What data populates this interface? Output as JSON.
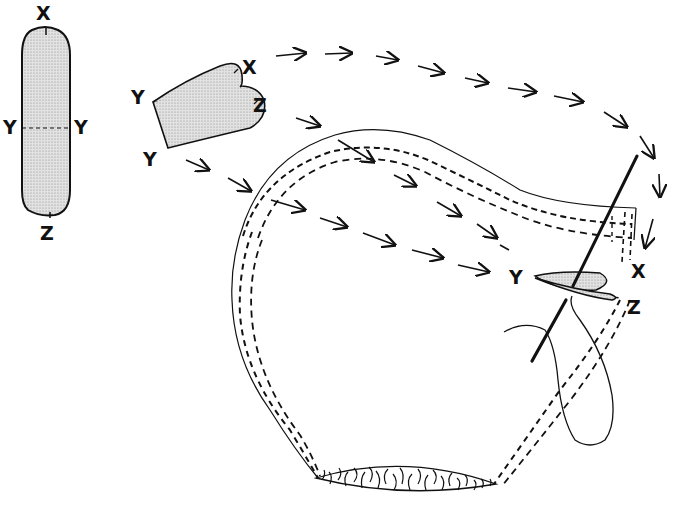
{
  "colors": {
    "ink": "#111111",
    "fill": "#d4d4d4",
    "background": "#ffffff"
  },
  "strip": {
    "labels": {
      "top": "X",
      "left_mid": "Y",
      "right_mid": "Y",
      "bottom": "Z"
    }
  },
  "folded_piece": {
    "labels": {
      "top_left": "Y",
      "bottom_left": "Y",
      "tip_top": "X",
      "tip_bottom": "Z"
    }
  },
  "assembly": {
    "labels": {
      "y_point": "Y",
      "x_point": "X",
      "z_point": "Z"
    }
  },
  "icons": [
    "arrow-icon",
    "needle-icon",
    "thread-loop-icon",
    "fur-trim-icon"
  ]
}
